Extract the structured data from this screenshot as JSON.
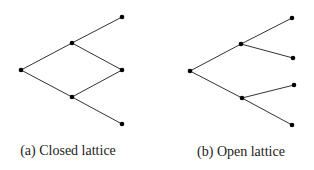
{
  "figures": [
    {
      "caption": "(a) Closed lattice",
      "nodes": [
        [
          21,
          70
        ],
        [
          72,
          43
        ],
        [
          72,
          97
        ],
        [
          122,
          17
        ],
        [
          122,
          70
        ],
        [
          122,
          124
        ]
      ],
      "edges": [
        [
          0,
          1
        ],
        [
          0,
          2
        ],
        [
          1,
          3
        ],
        [
          1,
          4
        ],
        [
          2,
          4
        ],
        [
          2,
          5
        ]
      ],
      "caption_pos": [
        68,
        143
      ]
    },
    {
      "caption": "(b) Open lattice",
      "nodes": [
        [
          190,
          71
        ],
        [
          241,
          44
        ],
        [
          242,
          98
        ],
        [
          292,
          18
        ],
        [
          293,
          58
        ],
        [
          294,
          85
        ],
        [
          292,
          125
        ]
      ],
      "edges": [
        [
          0,
          1
        ],
        [
          0,
          2
        ],
        [
          1,
          3
        ],
        [
          1,
          4
        ],
        [
          2,
          5
        ],
        [
          2,
          6
        ]
      ],
      "caption_pos": [
        241,
        144
      ]
    }
  ],
  "style": {
    "line_color": "#333333",
    "node_color": "#000000"
  }
}
